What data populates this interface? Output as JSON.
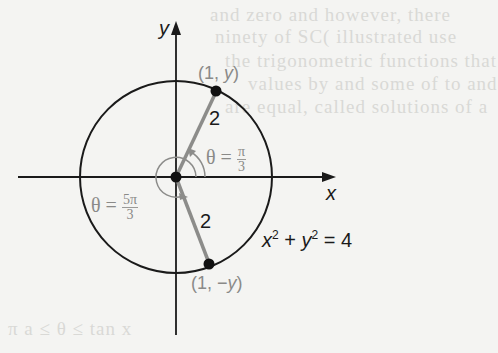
{
  "diagram": {
    "axes": {
      "x_label": "x",
      "y_label": "y"
    },
    "circle": {
      "equation_lhs_x": "x",
      "equation_sup_x": "2",
      "equation_plus": " + ",
      "equation_lhs_y": "y",
      "equation_sup_y": "2",
      "equation_rhs": " = 4",
      "radius": 2
    },
    "points": [
      {
        "label": "(1, y)",
        "lead": "(1, ",
        "var": "y",
        "tail": ")"
      },
      {
        "label": "(1, −y)",
        "lead": "(1, −",
        "var": "y",
        "tail": ")"
      }
    ],
    "segments": [
      {
        "length_label": "2"
      },
      {
        "length_label": "2"
      }
    ],
    "angles": [
      {
        "theta": "θ",
        "eq": " = ",
        "num": "π",
        "den": "3"
      },
      {
        "theta": "θ",
        "eq": " = ",
        "num": "5π",
        "den": "3"
      }
    ],
    "colors": {
      "ink": "#1a1a1a",
      "gray_segment": "#8c8c8a",
      "gray_text": "#8a8a88",
      "paper": "#f4f4f2"
    }
  },
  "bleed_through": [
    "and  zero  and  however,  there",
    "ninety  of  SC(  illustrated  use",
    "the  trigonometric  functions  that",
    "values  by  and  some  of  to  and",
    "are  equal,  called  solutions  of  a",
    "π       a  ≤  θ  ≤      tan  x"
  ]
}
